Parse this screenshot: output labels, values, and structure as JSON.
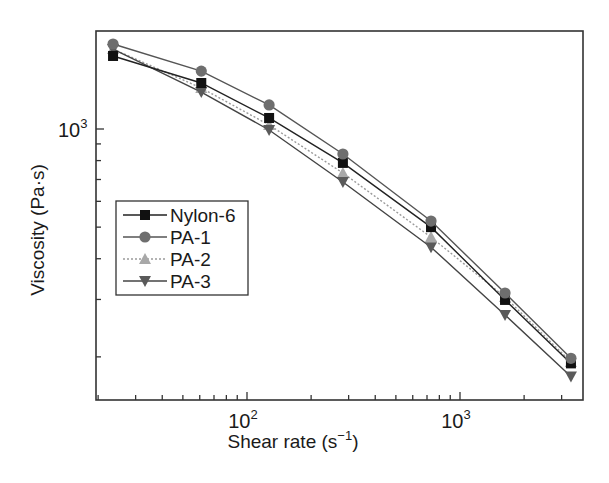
{
  "chart_data": {
    "type": "line",
    "title": "",
    "xlabel": "Shear rate (s⁻¹)",
    "ylabel": "Viscosity (Pa·s)",
    "xscale": "log",
    "yscale": "log",
    "xlim": [
      20,
      4200
    ],
    "ylim": [
      150,
      2000
    ],
    "grid": false,
    "legend_position": "center-left",
    "x_tick_labels": [
      {
        "value": 100,
        "base": "10",
        "exp": "2"
      },
      {
        "value": 1000,
        "base": "10",
        "exp": "3"
      }
    ],
    "y_tick_labels": [
      {
        "value": 1000,
        "base": "10",
        "exp": "3"
      }
    ],
    "x": [
      23.5,
      61,
      127,
      282,
      731,
      1627,
      3318
    ],
    "series": [
      {
        "name": "Nylon-6",
        "marker": "square",
        "color": "#111111",
        "line_color": "#222222",
        "dash": "",
        "values": [
          1675,
          1384,
          1081,
          787,
          500,
          299,
          191
        ]
      },
      {
        "name": "PA-1",
        "marker": "circle",
        "color": "#6e6e6e",
        "line_color": "#555555",
        "dash": "",
        "values": [
          1823,
          1505,
          1185,
          838,
          522,
          314,
          198
        ]
      },
      {
        "name": "PA-2",
        "marker": "triangle-up",
        "color": "#a8a8a8",
        "line_color": "#9a9a9a",
        "dash": "2,2",
        "values": [
          1759,
          1336,
          1029,
          733,
          466,
          305,
          193
        ]
      },
      {
        "name": "PA-3",
        "marker": "triangle-down",
        "color": "#5a5a5a",
        "line_color": "#444444",
        "dash": "",
        "values": [
          1759,
          1298,
          993,
          688,
          434,
          269,
          174
        ]
      }
    ]
  }
}
